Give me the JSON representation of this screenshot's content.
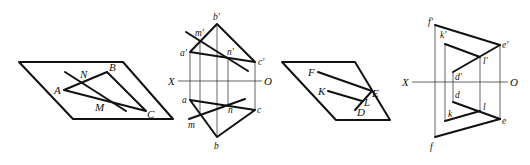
{
  "figures": [
    {
      "id": "fig1",
      "description": "Plane parallelogram with triangle ABC and line through N and M",
      "labels": {
        "A": "A",
        "B": "B",
        "C": "C",
        "N": "N",
        "M": "M"
      }
    },
    {
      "id": "fig2",
      "description": "Orthographic projections of triangle abc and line mn",
      "labels": {
        "b_prime": "b′",
        "a_prime": "a′",
        "c_prime": "c′",
        "m_prime": "m′",
        "n_prime": "n′",
        "X": "X",
        "O": "O",
        "a": "a",
        "b": "b",
        "c": "c",
        "m": "m",
        "n": "n"
      }
    },
    {
      "id": "fig3",
      "description": "Plane parallelogram with lines FE, KL, DE",
      "labels": {
        "F": "F",
        "K": "K",
        "E": "E",
        "L": "L",
        "D": "D"
      }
    },
    {
      "id": "fig4",
      "description": "Orthographic projections of frame with points f, k, d, l, e",
      "labels": {
        "f_prime": "f′",
        "k_prime": "k′",
        "e_prime": "e′",
        "l_prime": "l′",
        "d_prime": "d′",
        "X": "X",
        "O": "O",
        "d": "d",
        "k": "k",
        "l": "l",
        "e": "e",
        "f": "f"
      }
    }
  ]
}
